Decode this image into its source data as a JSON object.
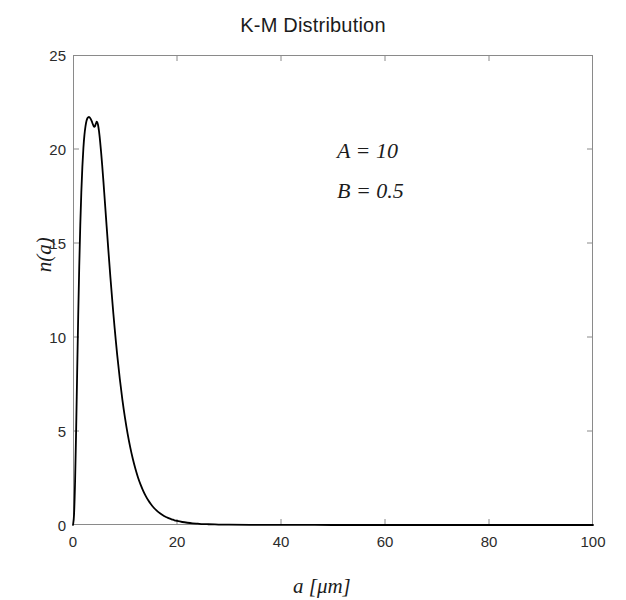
{
  "figure": {
    "width": 626,
    "height": 600,
    "background_color": "#ffffff",
    "axes_color": "#8a8a8a",
    "curve_color": "#000000"
  },
  "chart_data": {
    "type": "line",
    "title": "K-M Distribution",
    "xlabel": "a [μm]",
    "ylabel": "n(a)",
    "xlim": [
      0,
      100
    ],
    "ylim": [
      0,
      25
    ],
    "xticks": [
      0,
      20,
      40,
      60,
      80,
      100
    ],
    "xtick_labels": [
      "0",
      "20",
      "40",
      "60",
      "80",
      "100"
    ],
    "yticks": [
      0,
      5,
      10,
      15,
      20,
      25
    ],
    "ytick_labels": [
      "0",
      "5",
      "10",
      "15",
      "20",
      "25"
    ],
    "grid": false,
    "legend": null,
    "tick_direction": "in",
    "box": true,
    "annotations": [
      {
        "text": "A = 10",
        "x": 47,
        "y": 22.0
      },
      {
        "text": "B = 0.5",
        "x": 47,
        "y": 19.8
      }
    ],
    "parameters": {
      "A": 10,
      "B": 0.5
    },
    "peak": {
      "x": 4.6,
      "y": 21.7
    },
    "series": [
      {
        "name": "n(a)",
        "line_width": 1.8,
        "color": "#000000",
        "x": [
          0.0,
          0.2,
          0.4,
          0.6,
          0.8,
          1.0,
          1.2,
          1.4,
          1.6,
          1.8,
          2.0,
          2.2,
          2.4,
          2.6,
          2.8,
          3.0,
          3.2,
          3.4,
          3.6,
          3.8,
          4.0,
          4.2,
          4.4,
          4.6,
          4.8,
          5.0,
          5.2,
          5.4,
          5.6,
          5.8,
          6.0,
          6.4,
          6.8,
          7.2,
          7.6,
          8.0,
          8.5,
          9.0,
          9.5,
          10.0,
          10.5,
          11.0,
          11.5,
          12.0,
          12.5,
          13.0,
          13.5,
          14.0,
          14.5,
          15.0,
          15.5,
          16.0,
          16.5,
          17.0,
          17.5,
          18.0,
          18.5,
          19.0,
          19.5,
          20.0,
          21.0,
          22.0,
          23.0,
          24.0,
          25.0,
          26.0,
          28.0,
          30.0,
          34.0,
          40.0,
          50.0,
          60.0,
          70.0,
          80.0,
          90.0,
          100.0
        ],
        "y": [
          0.0,
          0.55,
          2.3,
          5.0,
          8.1,
          11.1,
          13.75,
          15.95,
          17.7,
          19.05,
          20.05,
          20.75,
          21.2,
          21.5,
          21.65,
          21.7,
          21.68,
          21.6,
          21.48,
          21.33,
          21.2,
          21.2,
          21.35,
          21.45,
          21.3,
          20.95,
          20.45,
          19.85,
          19.18,
          18.46,
          17.7,
          16.15,
          14.62,
          13.15,
          11.78,
          10.5,
          9.05,
          7.78,
          6.66,
          5.7,
          4.86,
          4.14,
          3.52,
          2.99,
          2.53,
          2.15,
          1.82,
          1.54,
          1.3,
          1.1,
          0.93,
          0.79,
          0.67,
          0.57,
          0.48,
          0.41,
          0.35,
          0.3,
          0.25,
          0.215,
          0.16,
          0.12,
          0.09,
          0.07,
          0.05,
          0.04,
          0.025,
          0.016,
          0.008,
          0.003,
          0.001,
          0.0005,
          0.0003,
          0.0002,
          0.0001,
          0.0001
        ]
      }
    ]
  }
}
